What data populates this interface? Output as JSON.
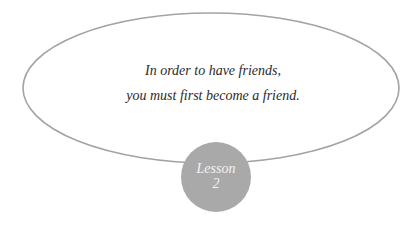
{
  "quote": {
    "line1": "In order to have friends,",
    "line2": "you must first become a friend."
  },
  "badge": {
    "label": "Lesson",
    "number": "2"
  },
  "colors": {
    "ellipse_stroke": "#a3a3a3",
    "badge_fill": "#a9a9a9",
    "badge_text": "#f4f4f4",
    "quote_text": "#2a2a2a"
  }
}
